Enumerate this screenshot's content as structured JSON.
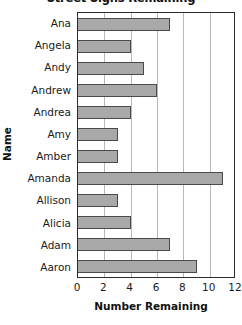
{
  "chart_data": {
    "type": "bar",
    "orientation": "horizontal",
    "title": "Street Signs Remaining",
    "xlabel": "Number Remaining",
    "ylabel": "Name",
    "categories": [
      "Ana",
      "Angela",
      "Andy",
      "Andrew",
      "Andrea",
      "Amy",
      "Amber",
      "Amanda",
      "Allison",
      "Alicia",
      "Adam",
      "Aaron"
    ],
    "values": [
      7,
      4,
      5,
      6,
      4,
      3,
      3,
      11,
      3,
      4,
      7,
      9
    ],
    "xlim": [
      0,
      12
    ],
    "xticks": [
      0,
      2,
      4,
      6,
      8,
      10,
      12
    ],
    "xtick_labels": [
      "0",
      "2",
      "4",
      "6",
      "8",
      "10",
      "12"
    ],
    "grid": "vertical",
    "legend": "none",
    "bar_color": "#a9a9a9",
    "bar_edge_color": "#4a4a4a",
    "gridline_color": "#b9b9b9",
    "axis_color": "#2b2b2b",
    "background_color": "#ffffff"
  }
}
